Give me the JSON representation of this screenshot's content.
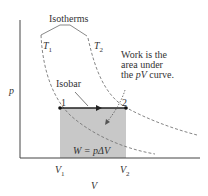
{
  "diagram": {
    "axis_x_label": "V",
    "axis_y_label": "p",
    "isotherms_label": "Isotherms",
    "isotherm_1": {
      "symbol": "T",
      "sub": "1"
    },
    "isotherm_2": {
      "symbol": "T",
      "sub": "2"
    },
    "isobar_label": "Isobar",
    "point_1": "1",
    "point_2": "2",
    "v1": {
      "symbol": "V",
      "sub": "1"
    },
    "v2": {
      "symbol": "V",
      "sub": "2"
    },
    "work_note_line1": "Work is the",
    "work_note_line2": "area under",
    "work_note_line3_pre": "the ",
    "work_note_line3_it": "pV",
    "work_note_line3_post": " curve.",
    "work_formula": "W = pΔV",
    "colors": {
      "shade": "#c8c8c8",
      "line": "#333333",
      "dashed": "#777777"
    }
  }
}
